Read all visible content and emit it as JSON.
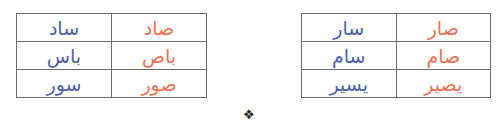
{
  "colors": {
    "sin_words": "#4f5fa8",
    "sad_words": "#e8735a",
    "border": "#6b6b6b"
  },
  "tables": [
    {
      "name": "left",
      "rows": [
        {
          "sin": "ساد",
          "sad": "صاد"
        },
        {
          "sin": "باس",
          "sad": "باص"
        },
        {
          "sin": "سور",
          "sad": "صور"
        }
      ]
    },
    {
      "name": "right",
      "rows": [
        {
          "sin": "سار",
          "sad": "صار"
        },
        {
          "sin": "سام",
          "sad": "صام"
        },
        {
          "sin": "يسير",
          "sad": "يصير"
        }
      ]
    }
  ],
  "separator_symbol": "❖"
}
